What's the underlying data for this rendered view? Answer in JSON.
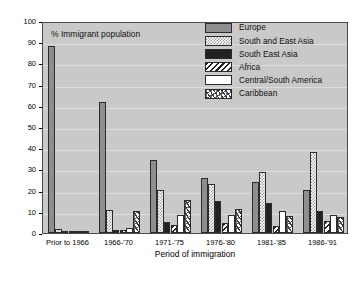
{
  "chart_data": {
    "type": "bar",
    "title": "% Immigrant population",
    "xlabel": "Period of immigration",
    "ylabel": "",
    "ylim": [
      0,
      100
    ],
    "ytick_step": 10,
    "grid": true,
    "legend_position": "top-right",
    "categories": [
      "Prior to 1966",
      "1966-'70",
      "1971-'75",
      "1976-'80",
      "1981-'85",
      "1986-'91"
    ],
    "yticks": [
      "0",
      "10",
      "20",
      "30",
      "40",
      "50",
      "60",
      "70",
      "80",
      "90",
      "100"
    ],
    "series": [
      {
        "name": "Europe",
        "pattern": "solid-gray",
        "color": "#8e8e8e",
        "values": [
          88,
          62,
          34.5,
          26,
          24,
          20.5
        ]
      },
      {
        "name": "South and East Asia",
        "pattern": "fine-checker",
        "color": "#ffffff",
        "values": [
          2,
          11,
          20.5,
          23,
          29,
          38
        ]
      },
      {
        "name": "South East Asia",
        "pattern": "solid-black",
        "color": "#222222",
        "values": [
          0.3,
          1.5,
          5,
          15,
          14,
          10.5
        ]
      },
      {
        "name": "Africa",
        "pattern": "diagonal-stripes",
        "color": "#ffffff",
        "values": [
          0.3,
          1.5,
          4,
          4.5,
          3.5,
          5.5
        ]
      },
      {
        "name": "Central/South America",
        "pattern": "solid-white",
        "color": "#ffffff",
        "values": [
          0.3,
          2.5,
          8.5,
          8.5,
          10.5,
          8.5
        ]
      },
      {
        "name": "Caribbean",
        "pattern": "coarse-speckle",
        "color": "#ffffff",
        "values": [
          1,
          10.5,
          15.5,
          11.5,
          8,
          7.5
        ]
      }
    ]
  }
}
